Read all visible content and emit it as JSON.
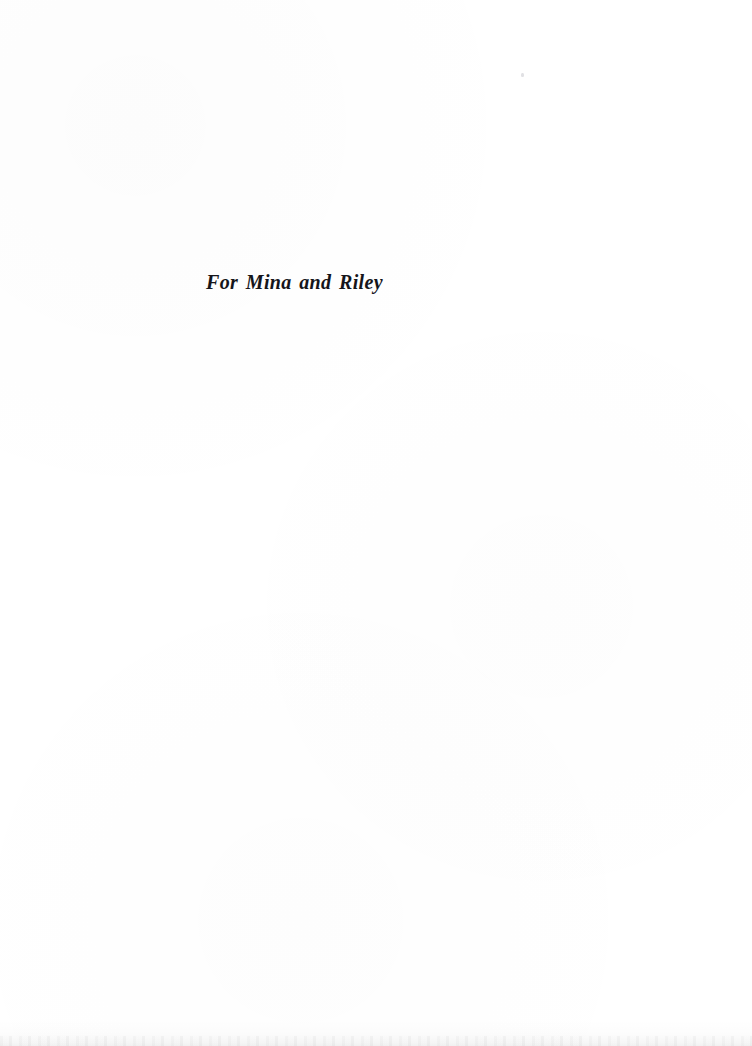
{
  "page": {
    "kind": "book-dedication-page",
    "width": 752,
    "height": 1046,
    "background_color": "#ffffff",
    "text_color": "#15151a"
  },
  "dedication": {
    "text": "For Mina and Riley"
  },
  "artifacts": {
    "scan_speck_label": "",
    "scan_edge_label": ""
  }
}
